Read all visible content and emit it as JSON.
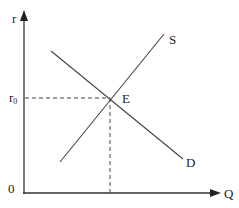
{
  "diagram": {
    "axes": {
      "y_label": "r",
      "x_label": "Q",
      "origin_label": "0",
      "y_tick_label_base": "r",
      "y_tick_label_sub": "0"
    },
    "curves": {
      "supply_label": "S",
      "demand_label": "D"
    },
    "equilibrium": {
      "label": "E"
    },
    "colors": {
      "line": "#444444",
      "text": "#222222"
    }
  }
}
